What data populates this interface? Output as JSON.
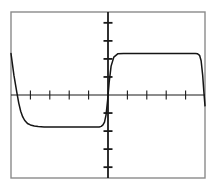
{
  "figure": {
    "name": "square-wave-plot",
    "background_color": "#ffffff",
    "frame_color": "#8a8a8a",
    "axis_color": "#1a1a1a",
    "trace_color": "#151515",
    "frame": {
      "x": 11,
      "y": 12,
      "width": 194,
      "height": 166
    }
  },
  "chart_data": {
    "type": "line",
    "title": "",
    "subtitle": "",
    "xlabel": "",
    "ylabel": "",
    "grid": false,
    "legend": null,
    "legend_position": "none",
    "axis_style": "centered-crosshair",
    "xlim": [
      -5.0,
      5.0
    ],
    "ylim": [
      -4.6,
      4.6
    ],
    "xticks": [
      -4,
      -3,
      -2,
      -1,
      1,
      2,
      3,
      4
    ],
    "yticks": [
      -4,
      -3,
      -2,
      -1,
      1,
      2,
      3,
      4
    ],
    "xtick_labels": [
      "",
      "",
      "",
      "",
      "",
      "",
      "",
      ""
    ],
    "ytick_labels": [
      "",
      "",
      "",
      "",
      "",
      "",
      "",
      ""
    ],
    "x_axis_value": 0,
    "y_axis_value": 0,
    "annotations": [],
    "series": [
      {
        "name": "square wave",
        "description": "bipolar square wave with exponential RC-style rising and falling edges",
        "high_level": 2.3,
        "low_level": -1.78,
        "period": 10.0,
        "duty_cycle": 0.5,
        "x": [
          -5.0,
          -4.85,
          -4.7,
          -4.6,
          -4.5,
          -4.4,
          -4.3,
          -4.15,
          -4.0,
          -3.8,
          -3.6,
          -3.3,
          -3.0,
          -2.5,
          -2.0,
          -1.5,
          -1.0,
          -0.6,
          -0.45,
          -0.35,
          -0.26,
          -0.18,
          -0.1,
          -0.02,
          0.06,
          0.16,
          0.3,
          0.5,
          0.8,
          1.2,
          1.8,
          2.4,
          3.0,
          3.6,
          4.0,
          4.3,
          4.5,
          4.62,
          4.72,
          4.8,
          4.88,
          4.94,
          5.0
        ],
        "y": [
          2.3,
          1.1,
          0.15,
          -0.45,
          -0.9,
          -1.2,
          -1.4,
          -1.58,
          -1.66,
          -1.72,
          -1.75,
          -1.77,
          -1.78,
          -1.78,
          -1.78,
          -1.78,
          -1.78,
          -1.78,
          -1.77,
          -1.74,
          -1.66,
          -1.5,
          -1.1,
          -0.3,
          0.7,
          1.6,
          2.1,
          2.28,
          2.3,
          2.3,
          2.3,
          2.3,
          2.3,
          2.3,
          2.3,
          2.3,
          2.3,
          2.28,
          2.2,
          1.9,
          1.1,
          0.2,
          -0.6
        ]
      }
    ]
  }
}
